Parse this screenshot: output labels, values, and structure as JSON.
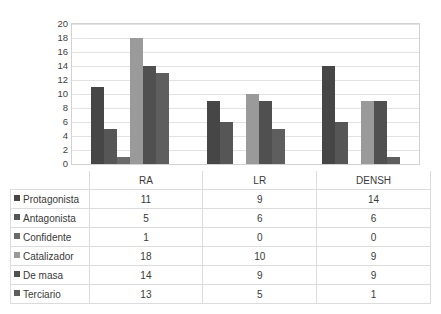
{
  "chart_data": {
    "type": "bar",
    "title": "",
    "xlabel": "",
    "ylabel": "",
    "ylim": [
      0,
      20
    ],
    "ytick_step": 2,
    "yticks": [
      20,
      18,
      16,
      14,
      12,
      10,
      8,
      6,
      4,
      2,
      0
    ],
    "grid": true,
    "legend_position": "table-row-headers",
    "categories": [
      "RA",
      "LR",
      "DENSH"
    ],
    "series": [
      {
        "name": "Protagonista",
        "values": [
          11,
          9,
          14
        ],
        "color": "#464646"
      },
      {
        "name": "Antagonista",
        "values": [
          5,
          6,
          6
        ],
        "color": "#565656"
      },
      {
        "name": "Confidente",
        "values": [
          1,
          0,
          0
        ],
        "color": "#6a6a6a"
      },
      {
        "name": "Catalizador",
        "values": [
          18,
          10,
          9
        ],
        "color": "#9a9a9a"
      },
      {
        "name": "De masa",
        "values": [
          14,
          9,
          9
        ],
        "color": "#505050"
      },
      {
        "name": "Terciario",
        "values": [
          13,
          5,
          1
        ],
        "color": "#5e5e5e"
      }
    ]
  },
  "table": {
    "corner_label": "",
    "column_headers": [
      "RA",
      "LR",
      "DENSH"
    ],
    "rows": [
      {
        "label": "Protagonista",
        "swatch": "#464646",
        "values": [
          "11",
          "9",
          "14"
        ]
      },
      {
        "label": "Antagonista",
        "swatch": "#565656",
        "values": [
          "5",
          "6",
          "6"
        ]
      },
      {
        "label": "Confidente",
        "swatch": "#6a6a6a",
        "values": [
          "1",
          "0",
          "0"
        ]
      },
      {
        "label": "Catalizador",
        "swatch": "#9a9a9a",
        "values": [
          "18",
          "10",
          "9"
        ]
      },
      {
        "label": "De masa",
        "swatch": "#505050",
        "values": [
          "14",
          "9",
          "9"
        ]
      },
      {
        "label": "Terciario",
        "swatch": "#5e5e5e",
        "values": [
          "13",
          "5",
          "1"
        ]
      }
    ]
  }
}
